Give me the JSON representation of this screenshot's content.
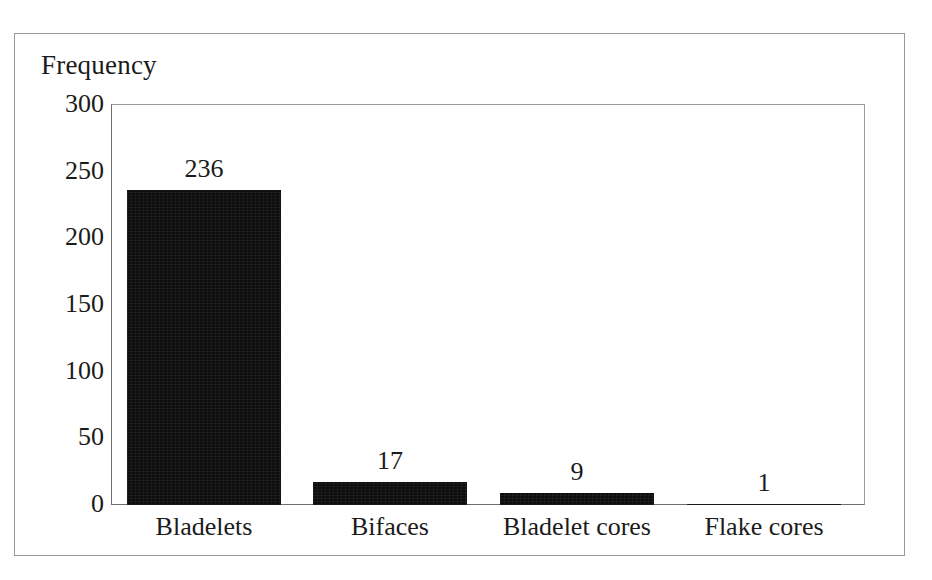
{
  "chart_data": {
    "type": "bar",
    "title": "Frequency",
    "xlabel": "",
    "ylabel": "Frequency",
    "categories": [
      "Bladelets",
      "Bifaces",
      "Bladelet cores",
      "Flake cores"
    ],
    "values": [
      236,
      17,
      9,
      1
    ],
    "data_labels": [
      "236",
      "17",
      "9",
      "1"
    ],
    "ylim": [
      0,
      300
    ],
    "yticks": [
      0,
      50,
      100,
      150,
      200,
      250,
      300
    ],
    "ytick_labels": [
      "300",
      "250",
      "200",
      "150",
      "100",
      "50",
      "0"
    ],
    "grid": false,
    "legend": false,
    "legend_position": "none",
    "series": [
      {
        "name": "Frequency",
        "values": [
          236,
          17,
          9,
          1
        ]
      }
    ],
    "bar_color": "#0d0d0d",
    "background_color": "#ffffff",
    "axis_color": "#6e6e6e"
  },
  "figure": {
    "axis_title": "Frequency",
    "frame_border_color": "#9a9a9a"
  }
}
